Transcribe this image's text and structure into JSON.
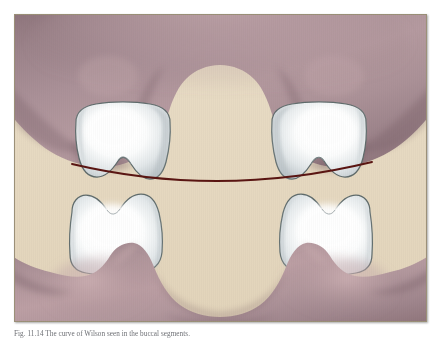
{
  "figure": {
    "caption": "Fig. 11.14  The curve of Wilson seen in the buccal segments.",
    "panel": {
      "background_color": "#e6d9c1",
      "border_color": "#9b9078",
      "width": 413,
      "height": 308
    },
    "anatomy": {
      "upper_gingiva_label": "maxillary gingiva",
      "lower_gingiva_label": "mandibular gingiva",
      "upper_left_tooth_label": "maxillary left molar",
      "upper_right_tooth_label": "maxillary right molar",
      "lower_left_tooth_label": "mandibular left molar",
      "lower_right_tooth_label": "mandibular right molar"
    },
    "colors": {
      "background_beige": "#e6d9c1",
      "gingiva_mauve": "#a58c92",
      "gingiva_shadow": "#7d6268",
      "gingiva_highlight": "#c9aeb1",
      "enamel_white": "#ffffff",
      "enamel_shade": "#c8ccd0",
      "enamel_outline": "#5f6b6b",
      "curve_line": "#5a1512"
    },
    "occlusal_curve": {
      "name": "curve-of-wilson",
      "color": "#5a1512",
      "stroke_width": 1.8,
      "start_point": [
        58,
        150
      ],
      "control_point": [
        206,
        185
      ],
      "end_point": [
        358,
        148
      ]
    }
  }
}
